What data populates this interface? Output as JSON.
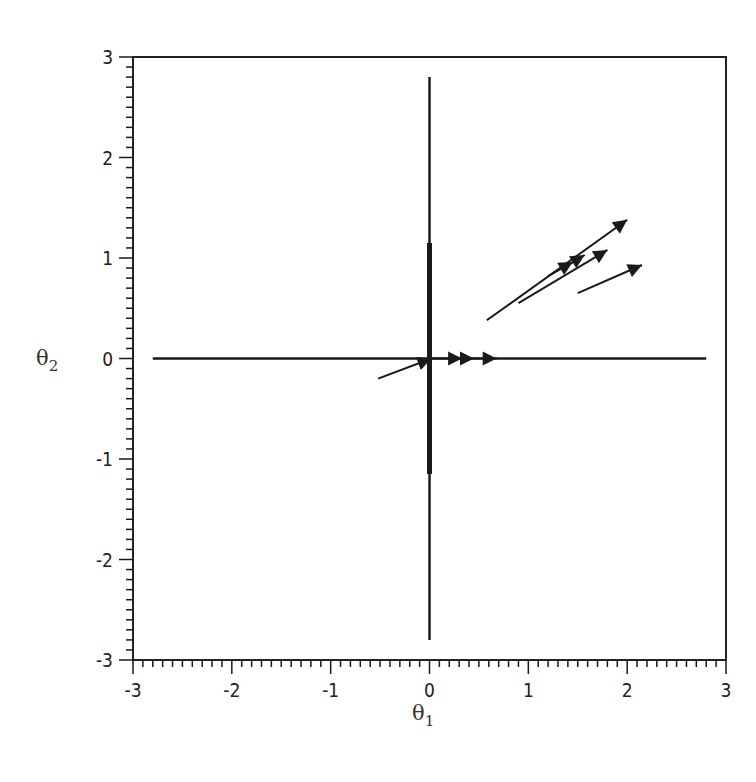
{
  "chart_data": {
    "type": "quiver",
    "title": "",
    "xlabel": "θ1",
    "ylabel": "θ2",
    "xlabel_symbol": "θ",
    "xlabel_sub": "1",
    "ylabel_symbol": "θ",
    "ylabel_sub": "2",
    "xlim": [
      -3,
      3
    ],
    "ylim": [
      -3,
      3
    ],
    "x_ticks": [
      "-3",
      "-2",
      "-1",
      "0",
      "1",
      "2",
      "3"
    ],
    "y_ticks": [
      "3",
      "2",
      "1",
      "0",
      "-1",
      "-2",
      "-3"
    ],
    "minor_tick_step": 0.1,
    "grid": false,
    "legend": null,
    "axes_lines": {
      "horizontal": {
        "x": [
          -2.8,
          2.8
        ],
        "y": 0
      },
      "vertical": {
        "x": 0,
        "y": [
          -2.8,
          2.8
        ]
      },
      "vertical_thick_segment": {
        "x": 0,
        "y": [
          -1.15,
          1.15
        ]
      }
    },
    "arrows": [
      {
        "from": [
          0.58,
          0.38
        ],
        "to": [
          2.0,
          1.38
        ]
      },
      {
        "from": [
          0.9,
          0.55
        ],
        "to": [
          1.8,
          1.08
        ]
      },
      {
        "from": [
          1.2,
          0.82
        ],
        "to": [
          1.45,
          0.96
        ]
      },
      {
        "from": [
          1.35,
          0.9
        ],
        "to": [
          1.57,
          1.03
        ]
      },
      {
        "from": [
          1.5,
          0.65
        ],
        "to": [
          2.15,
          0.93
        ]
      },
      {
        "from": [
          -0.52,
          -0.2
        ],
        "to": [
          0.02,
          0.0
        ]
      },
      {
        "from": [
          0.0,
          0.0
        ],
        "to": [
          0.33,
          0.0
        ]
      },
      {
        "from": [
          0.3,
          0.0
        ],
        "to": [
          0.45,
          0.0
        ]
      },
      {
        "from": [
          0.45,
          0.0
        ],
        "to": [
          0.68,
          0.0
        ]
      }
    ],
    "colors": {
      "line": "#1a1a1a",
      "frame": "#222222",
      "background": "#ffffff"
    }
  }
}
